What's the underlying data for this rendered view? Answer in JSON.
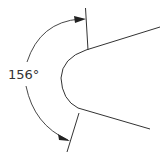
{
  "diagram": {
    "title": "",
    "dimension": {
      "value": "156",
      "unit": "°",
      "label": "156°",
      "kind": "angular-dimension"
    },
    "colors": {
      "line": "#333333",
      "background": "#ffffff"
    }
  }
}
